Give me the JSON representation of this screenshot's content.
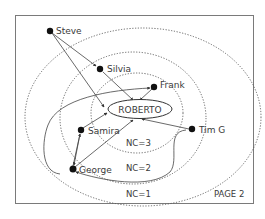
{
  "diagram": {
    "type": "social-network-circles",
    "page_label": "PAGE 2",
    "center": {
      "id": "roberto",
      "label": "ROBERTO"
    },
    "rings": [
      {
        "id": "nc3",
        "label": "NC=3"
      },
      {
        "id": "nc2",
        "label": "NC=2"
      },
      {
        "id": "nc1",
        "label": "NC=1"
      }
    ],
    "nodes": [
      {
        "id": "steve",
        "label": "Steve"
      },
      {
        "id": "silvia",
        "label": "Silvia"
      },
      {
        "id": "frank",
        "label": "Frank"
      },
      {
        "id": "samira",
        "label": "Samira"
      },
      {
        "id": "timg",
        "label": "Tim G"
      },
      {
        "id": "george",
        "label": "George"
      }
    ],
    "edges": [
      {
        "from": "steve",
        "to": "silvia"
      },
      {
        "from": "steve",
        "to": "roberto"
      },
      {
        "from": "silvia",
        "to": "roberto"
      },
      {
        "from": "frank",
        "to": "roberto"
      },
      {
        "from": "timg",
        "to": "roberto"
      },
      {
        "from": "samira",
        "to": "roberto"
      },
      {
        "from": "george",
        "to": "roberto"
      },
      {
        "from": "george",
        "to": "samira"
      },
      {
        "from": "george",
        "to": "frank",
        "style": "curve"
      },
      {
        "from": "timg",
        "to": "george",
        "style": "curve"
      }
    ],
    "colors": {
      "ink": "#333333",
      "frame": "#777777",
      "dotted": "#555555"
    }
  }
}
